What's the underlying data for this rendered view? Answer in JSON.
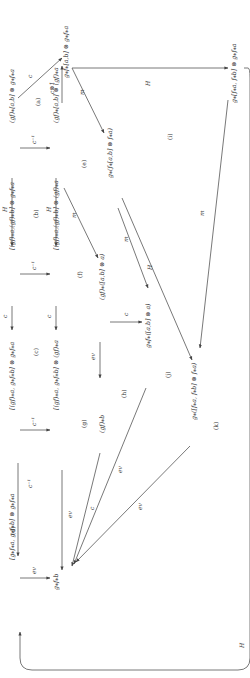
{
  "diagram": {
    "orientation": "rotated-90-ccw",
    "nodes": {
      "n1": "(gf)⁎[a,b] ⊗ g⁎f⁎a",
      "n2": "[(gf)⁎a,(gf)⁎b] ⊗ g⁎f⁎a",
      "n3": "[(gf)⁎a, g⁎f⁎b] ⊗ g⁎f⁎a",
      "n4": "[g⁎f⁎a, g⁎f⁎b] ⊗ g⁎f⁎a",
      "n5": "g⁎f⁎[a,b] ⊗ g⁎f⁎a",
      "n6": "(gf)⁎[a,b] ⊗ (gf)⁎a",
      "n7": "[(gf)⁎a,(gf)⁎b] ⊗ (gf)⁎a",
      "n8": "[(gf)⁎a, g⁎f⁎b] ⊗ (gf)⁎a",
      "n9": "g⁎f⁎b",
      "n10": "g⁎(f⁎[a,b] ⊗ f⁎a)",
      "n11": "(gf)⁎([a,b] ⊗ a)",
      "n12": "(gf)⁎b",
      "n13": "g⁎f⁎([a,b] ⊗ a)",
      "n14": "g⁎([f⁎a, f⁎b] ⊗ f⁎a)",
      "n15": "g⁎[f⁎a, f⁎b] ⊗ g⁎f⁎a"
    },
    "edge_labels": {
      "H_top_row": "H",
      "c_top_row": "c",
      "cinv_top_row": "c⁻¹",
      "cinv_n1_n6": "c⁻¹",
      "H_mid_row": "H",
      "cinv_n7_n8": "c⁻¹",
      "c_diag": "c",
      "c_otimes_1": "c⊗1",
      "m_n6_n11": "m",
      "m_n5_n10": "m",
      "ev_n4_n9": "ev",
      "ev_n8_n12": "ev",
      "ev_n11_n12": "ev",
      "c_n11_n13": "c",
      "c_n12_n9": "c",
      "ev_h": "ev",
      "ev_k": "ev",
      "m_n10_n13": "m",
      "H_n10_n14": "H",
      "H_bottom": "H",
      "m_bottom": "m",
      "H_outer": "H",
      "cinv_diag": "c⁻¹"
    },
    "regions": [
      "(a)",
      "(b)",
      "(c)",
      "(d)",
      "(e)",
      "(f)",
      "(g)",
      "(h)",
      "(i)",
      "(j)",
      "(k)",
      "(l)"
    ]
  }
}
